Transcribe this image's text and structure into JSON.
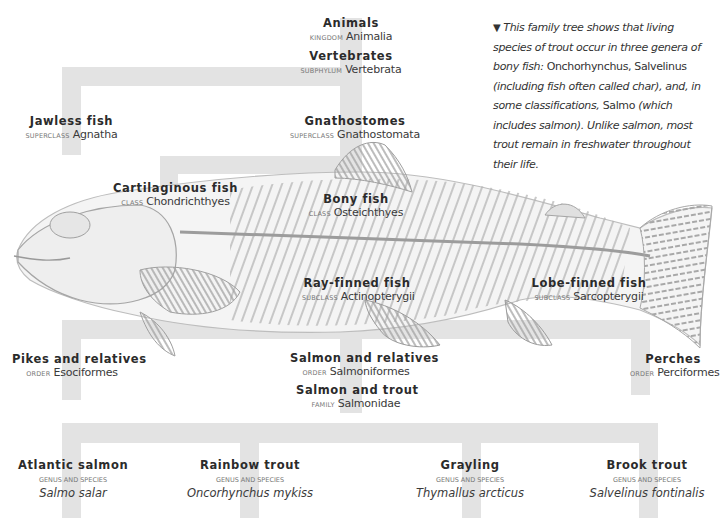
{
  "caption": {
    "marker": "▼",
    "segments": [
      {
        "text": "This family tree shows that living species of trout occur in three genera of bony fish: ",
        "italic": true
      },
      {
        "text": "Onchorhynchus, Salvelinus ",
        "italic": false
      },
      {
        "text": "(including fish often called char), and, in some classifications, ",
        "italic": true
      },
      {
        "text": "Salmo ",
        "italic": false
      },
      {
        "text": "(which includes salmon). Unlike salmon, most trout remain in freshwater throughout their life.",
        "italic": true
      }
    ]
  },
  "nodes": {
    "animals": {
      "common": "Animals",
      "rank": "Kingdom",
      "sci": "Animalia"
    },
    "vertebrates": {
      "common": "Vertebrates",
      "rank": "Subphylum",
      "sci": "Vertebrata"
    },
    "jawless": {
      "common": "Jawless fish",
      "rank": "Superclass",
      "sci": "Agnatha"
    },
    "gnathostomes": {
      "common": "Gnathostomes",
      "rank": "Superclass",
      "sci": "Gnathostomata"
    },
    "cartilaginous": {
      "common": "Cartilaginous fish",
      "rank": "Class",
      "sci": "Chondrichthyes"
    },
    "bony": {
      "common": "Bony fish",
      "rank": "Class",
      "sci": "Osteichthyes"
    },
    "rayfinned": {
      "common": "Ray-finned fish",
      "rank": "Subclass",
      "sci": "Actinopterygii"
    },
    "lobefinned": {
      "common": "Lobe-finned fish",
      "rank": "Subclass",
      "sci": "Sarcopterygii"
    },
    "pikes": {
      "common": "Pikes and relatives",
      "rank": "Order",
      "sci": "Esociformes"
    },
    "salmonrel": {
      "common": "Salmon and relatives",
      "rank": "Order",
      "sci": "Salmoniformes"
    },
    "perches": {
      "common": "Perches",
      "rank": "Order",
      "sci": "Perciformes"
    },
    "salmontrout": {
      "common": "Salmon and trout",
      "rank": "Family",
      "sci": "Salmonidae"
    }
  },
  "species": [
    {
      "common": "Atlantic salmon",
      "rank": "Genus and species",
      "binomial": "Salmo salar"
    },
    {
      "common": "Rainbow trout",
      "rank": "Genus and species",
      "binomial": "Oncorhynchus mykiss"
    },
    {
      "common": "Grayling",
      "rank": "Genus and species",
      "binomial": "Thymallus arcticus"
    },
    {
      "common": "Brook trout",
      "rank": "Genus and species",
      "binomial": "Salvelinus fontinalis"
    }
  ],
  "illustration": {
    "subject": "trout-skeleton-illustration"
  },
  "colors": {
    "tree_bar": "#e3e3e3",
    "text": "#2b2b2b",
    "rank": "#777777",
    "fish_line": "#9a9a9a"
  }
}
